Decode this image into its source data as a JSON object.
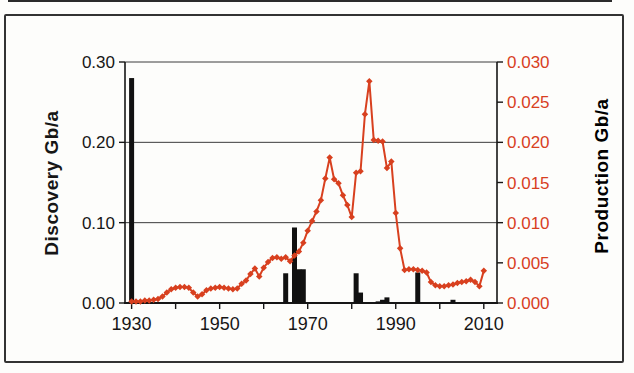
{
  "figure": {
    "background": "#fdfdfb",
    "frame_color": "#333333",
    "scan_strip_color": "#2b2b2b"
  },
  "chart_data": {
    "type": "combo-bar-line",
    "title": "",
    "grid": "horizontal-on",
    "x_axis": {
      "range": [
        1928.5,
        2013
      ],
      "tick_years": [
        1930,
        1940,
        1950,
        1960,
        1970,
        1980,
        1990,
        2000,
        2010
      ],
      "label_years": [
        1930,
        1950,
        1970,
        1990,
        2010
      ],
      "color": "#161616"
    },
    "left_axis": {
      "title": "Discovery Gb/a",
      "max": 0.3,
      "tick_labels": [
        "0.00",
        "0.10",
        "0.20",
        "0.30"
      ],
      "gridline_values": [
        0.1,
        0.2,
        0.3
      ],
      "color": "#161616"
    },
    "right_axis": {
      "title": "Production Gb/a",
      "max": 0.03,
      "tick_labels": [
        "0.000",
        "0.005",
        "0.010",
        "0.015",
        "0.020",
        "0.025",
        "0.030"
      ],
      "color": "#d8401f"
    },
    "series": [
      {
        "name": "Discovery",
        "type": "bar",
        "axis": "left",
        "color": "#111111",
        "bar_width": 5,
        "points": [
          {
            "year": 1930,
            "value": 0.28
          },
          {
            "year": 1965,
            "value": 0.037
          },
          {
            "year": 1967,
            "value": 0.094
          },
          {
            "year": 1968,
            "value": 0.042
          },
          {
            "year": 1969,
            "value": 0.042
          },
          {
            "year": 1981,
            "value": 0.037
          },
          {
            "year": 1982,
            "value": 0.013
          },
          {
            "year": 1986,
            "value": 0.002
          },
          {
            "year": 1987,
            "value": 0.004
          },
          {
            "year": 1988,
            "value": 0.007
          },
          {
            "year": 1995,
            "value": 0.038
          },
          {
            "year": 2003,
            "value": 0.004
          }
        ]
      },
      {
        "name": "Production",
        "type": "line",
        "axis": "right",
        "color": "#d8401f",
        "marker": "diamond",
        "start_year": 1930,
        "values": [
          0.0002,
          0.0002,
          0.0002,
          0.0003,
          0.0003,
          0.0004,
          0.0005,
          0.0008,
          0.0013,
          0.0017,
          0.0019,
          0.002,
          0.002,
          0.0019,
          0.0013,
          0.0008,
          0.0011,
          0.0016,
          0.0018,
          0.0019,
          0.002,
          0.0019,
          0.0018,
          0.0017,
          0.0018,
          0.0024,
          0.0028,
          0.0036,
          0.0043,
          0.0033,
          0.0044,
          0.0051,
          0.0056,
          0.0057,
          0.0055,
          0.0057,
          0.0052,
          0.0059,
          0.0064,
          0.0075,
          0.009,
          0.0102,
          0.0114,
          0.0128,
          0.0155,
          0.0181,
          0.0154,
          0.0149,
          0.0134,
          0.0122,
          0.0107,
          0.0162,
          0.0164,
          0.0235,
          0.0276,
          0.0203,
          0.0202,
          0.0201,
          0.0168,
          0.0176,
          0.0112,
          0.0068,
          0.0041,
          0.0042,
          0.0042,
          0.0041,
          0.004,
          0.0038,
          0.0026,
          0.0022,
          0.0021,
          0.0021,
          0.0022,
          0.0023,
          0.0025,
          0.0026,
          0.0027,
          0.0029,
          0.0026,
          0.0021,
          0.004
        ]
      }
    ]
  }
}
